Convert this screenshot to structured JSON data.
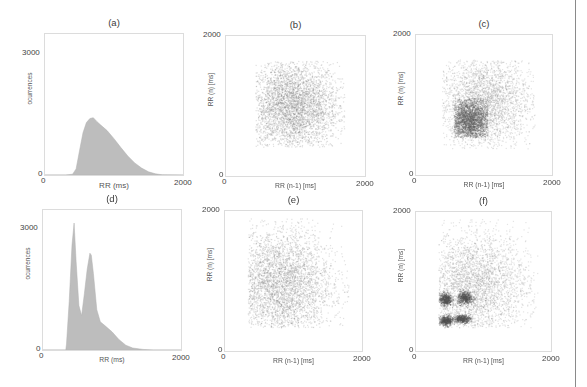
{
  "figure": {
    "panels": [
      {
        "id": "a",
        "title": "(a)",
        "kind": "histogram",
        "box": [
          44,
          33,
          140,
          143
        ],
        "xlabel": "RR (ms)",
        "ylabel": "ocurrences",
        "xticks": [
          "0",
          "2000"
        ],
        "yticks": [
          "0",
          "3000"
        ],
        "ytop_label_y": 53
      },
      {
        "id": "b",
        "title": "(b)",
        "kind": "scatter",
        "box": [
          225,
          35,
          141,
          142
        ],
        "xlabel": "RR (n-1) [ms]",
        "ylabel": "RR (n) [ms]",
        "xticks": [
          "0",
          "2000"
        ],
        "yticks": [
          "0",
          "2000"
        ]
      },
      {
        "id": "c",
        "title": "(c)",
        "kind": "scatter",
        "box": [
          415,
          34,
          138,
          142
        ],
        "xlabel": "RR (n-1) [ms]",
        "ylabel": "RR (n) [ms]",
        "xticks": [
          "0",
          "2000"
        ],
        "yticks": [
          "0",
          "2000"
        ]
      },
      {
        "id": "d",
        "title": "(d)",
        "kind": "histogram",
        "box": [
          42,
          209,
          140,
          142
        ],
        "xlabel": "RR (ms)",
        "ylabel": "ocurrences",
        "xticks": [
          "0",
          "2000"
        ],
        "yticks": [
          "0",
          "3000"
        ],
        "ytop_label_y": 228
      },
      {
        "id": "e",
        "title": "(e)",
        "kind": "scatter",
        "box": [
          224,
          210,
          139,
          142
        ],
        "xlabel": "RR (n-1) [ms]",
        "ylabel": "RR (n) [ms]",
        "xticks": [
          "0",
          "2000"
        ],
        "yticks": [
          "0",
          "2000"
        ]
      },
      {
        "id": "f",
        "title": "(f)",
        "kind": "scatter",
        "box": [
          415,
          211,
          137,
          141
        ],
        "xlabel": "RR (n-1) [ms]",
        "ylabel": "RR (n) [ms]",
        "xticks": [
          "0",
          "2000"
        ],
        "yticks": [
          "0",
          "2000"
        ]
      }
    ],
    "colors": {
      "fill": "#bdbdbd",
      "dense": "#6e6e6e",
      "border": "#dcdcdc",
      "text": "#444444"
    }
  },
  "chart_data": [
    {
      "panel": "(a)",
      "type": "area",
      "title": "(a)",
      "xlabel": "RR (ms)",
      "ylabel": "ocurrences",
      "xlim": [
        0,
        2000
      ],
      "ylim": [
        0,
        3500
      ],
      "xticks": [
        0,
        2000
      ],
      "yticks": [
        0,
        3000
      ],
      "x": [
        0,
        300,
        400,
        450,
        500,
        550,
        600,
        650,
        700,
        750,
        800,
        900,
        1000,
        1100,
        1200,
        1300,
        1400,
        1500,
        1600,
        1700,
        2000
      ],
      "values": [
        0,
        0,
        20,
        150,
        600,
        1050,
        1300,
        1400,
        1420,
        1330,
        1250,
        1100,
        900,
        680,
        470,
        300,
        170,
        80,
        30,
        5,
        0
      ]
    },
    {
      "panel": "(b)",
      "type": "scatter",
      "title": "(b)",
      "xlabel": "RR (n-1) [ms]",
      "ylabel": "RR (n) [ms]",
      "xlim": [
        0,
        2000
      ],
      "ylim": [
        0,
        2000
      ],
      "xticks": [
        0,
        2000
      ],
      "yticks": [
        0,
        2000
      ],
      "clusters": [
        {
          "cx": 950,
          "cy": 1000,
          "sx": 330,
          "sy": 330,
          "n": 4200,
          "shade": 0.55,
          "xmin": 420,
          "ymin": 420,
          "xmax": 1700,
          "ymax": 1650
        }
      ]
    },
    {
      "panel": "(c)",
      "type": "scatter",
      "title": "(c)",
      "xlabel": "RR (n-1) [ms]",
      "ylabel": "RR (n) [ms]",
      "xlim": [
        0,
        2000
      ],
      "ylim": [
        0,
        2000
      ],
      "xticks": [
        0,
        2000
      ],
      "yticks": [
        0,
        2000
      ],
      "clusters": [
        {
          "cx": 1000,
          "cy": 1050,
          "sx": 340,
          "sy": 330,
          "n": 3200,
          "shade": 0.45,
          "xmin": 380,
          "ymin": 380,
          "xmax": 1750,
          "ymax": 1650
        },
        {
          "cx": 780,
          "cy": 780,
          "sx": 150,
          "sy": 160,
          "n": 2600,
          "shade": 0.85,
          "xmin": 550,
          "ymin": 540,
          "xmax": 1050,
          "ymax": 1100
        }
      ]
    },
    {
      "panel": "(d)",
      "type": "area",
      "title": "(d)",
      "xlabel": "RR (ms)",
      "ylabel": "ocurrences",
      "xlim": [
        0,
        2000
      ],
      "ylim": [
        0,
        3500
      ],
      "xticks": [
        0,
        2000
      ],
      "yticks": [
        0,
        3000
      ],
      "x": [
        0,
        330,
        340,
        380,
        420,
        450,
        480,
        520,
        560,
        600,
        640,
        680,
        700,
        730,
        780,
        830,
        900,
        1000,
        1100,
        1200,
        1300,
        1450,
        1600,
        2000
      ],
      "values": [
        0,
        0,
        150,
        1200,
        2600,
        3150,
        2200,
        1100,
        850,
        1400,
        2000,
        2400,
        2350,
        1900,
        1000,
        700,
        600,
        450,
        260,
        120,
        50,
        15,
        0,
        0
      ]
    },
    {
      "panel": "(e)",
      "type": "scatter",
      "title": "(e)",
      "xlabel": "RR (n-1) [ms]",
      "ylabel": "RR (n) [ms]",
      "xlim": [
        0,
        2000
      ],
      "ylim": [
        0,
        2000
      ],
      "xticks": [
        0,
        2000
      ],
      "yticks": [
        0,
        2000
      ],
      "clusters": [
        {
          "cx": 800,
          "cy": 950,
          "sx": 380,
          "sy": 400,
          "n": 4200,
          "shade": 0.5,
          "xmin": 330,
          "ymin": 340,
          "xmax": 1800,
          "ymax": 1900
        }
      ]
    },
    {
      "panel": "(f)",
      "type": "scatter",
      "title": "(f)",
      "xlabel": "RR (n-1) [ms]",
      "ylabel": "RR (n) [ms]",
      "xlim": [
        0,
        2000
      ],
      "ylim": [
        0,
        2000
      ],
      "xticks": [
        0,
        2000
      ],
      "yticks": [
        0,
        2000
      ],
      "clusters": [
        {
          "cx": 850,
          "cy": 950,
          "sx": 400,
          "sy": 380,
          "n": 3600,
          "shade": 0.45,
          "xmin": 330,
          "ymin": 340,
          "xmax": 1800,
          "ymax": 1900
        },
        {
          "cx": 430,
          "cy": 750,
          "sx": 45,
          "sy": 45,
          "n": 500,
          "shade": 1.0,
          "xmin": 330,
          "ymin": 600,
          "xmax": 560,
          "ymax": 900
        },
        {
          "cx": 720,
          "cy": 770,
          "sx": 55,
          "sy": 45,
          "n": 500,
          "shade": 1.0,
          "xmin": 580,
          "ymin": 620,
          "xmax": 880,
          "ymax": 900
        },
        {
          "cx": 440,
          "cy": 440,
          "sx": 50,
          "sy": 35,
          "n": 500,
          "shade": 1.0,
          "xmin": 330,
          "ymin": 340,
          "xmax": 580,
          "ymax": 560
        },
        {
          "cx": 680,
          "cy": 470,
          "sx": 60,
          "sy": 28,
          "n": 450,
          "shade": 1.0,
          "xmin": 520,
          "ymin": 380,
          "xmax": 850,
          "ymax": 560
        }
      ]
    }
  ]
}
